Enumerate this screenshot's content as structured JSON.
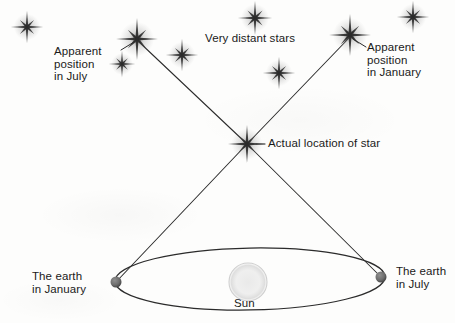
{
  "diagram": {
    "background_color": "#fdfdfc",
    "ink_color": "#2b2b2b",
    "labels": {
      "apparent_july": "Apparent\nposition\nin July",
      "apparent_january": "Apparent\nposition\nin January",
      "very_distant_stars": "Very distant stars",
      "actual_location": "Actual location of star",
      "earth_january": "The earth\nin January",
      "earth_july": "The earth\nin July",
      "sun": "Sun"
    },
    "stars": [
      {
        "name": "background-star-far-left",
        "x": 27,
        "y": 27,
        "size": 17,
        "weight": 1.0
      },
      {
        "name": "apparent-position-july-star",
        "x": 137,
        "y": 39,
        "size": 22,
        "weight": 1.25
      },
      {
        "name": "background-star-below-july",
        "x": 122,
        "y": 64,
        "size": 14,
        "weight": 0.85
      },
      {
        "name": "background-star-left-center",
        "x": 182,
        "y": 55,
        "size": 17,
        "weight": 1.0
      },
      {
        "name": "background-star-top-center",
        "x": 255,
        "y": 18,
        "size": 18,
        "weight": 1.0
      },
      {
        "name": "background-star-right-center",
        "x": 279,
        "y": 73,
        "size": 17,
        "weight": 1.0
      },
      {
        "name": "apparent-position-january-star",
        "x": 350,
        "y": 35,
        "size": 22,
        "weight": 1.25
      },
      {
        "name": "background-star-far-right",
        "x": 413,
        "y": 17,
        "size": 17,
        "weight": 1.0
      },
      {
        "name": "actual-star",
        "x": 247,
        "y": 144,
        "size": 20,
        "weight": 1.15
      }
    ],
    "orbit": {
      "name": "earth-orbit-ellipse",
      "center_x": 250,
      "center_y": 279,
      "radius_x": 135,
      "radius_y": 31,
      "rotation_deg": -1.0
    },
    "sun": {
      "name": "sun-disc",
      "x": 248,
      "y": 282,
      "radius": 19
    },
    "earths": [
      {
        "name": "earth-january-marker",
        "x": 116,
        "y": 282,
        "radius": 5.5
      },
      {
        "name": "earth-july-marker",
        "x": 381,
        "y": 277,
        "radius": 5.5
      }
    ],
    "sight_lines": [
      {
        "name": "sightline-january-to-star",
        "x1": 116,
        "y1": 282,
        "x2": 247,
        "y2": 144
      },
      {
        "name": "sightline-july-to-star",
        "x1": 381,
        "y1": 277,
        "x2": 247,
        "y2": 144
      },
      {
        "name": "sightline-star-to-apparent-july",
        "x1": 247,
        "y1": 144,
        "x2": 138,
        "y2": 41
      },
      {
        "name": "sightline-star-to-apparent-january",
        "x1": 247,
        "y1": 144,
        "x2": 349,
        "y2": 38
      }
    ],
    "leader_lines": [
      {
        "name": "leader-apparent-july",
        "x1": 121,
        "y1": 50,
        "x2": 134,
        "y2": 42
      },
      {
        "name": "leader-apparent-january",
        "x1": 366,
        "y1": 47,
        "x2": 353,
        "y2": 39
      },
      {
        "name": "leader-actual-location",
        "x1": 265,
        "y1": 144,
        "x2": 256,
        "y2": 144
      }
    ]
  }
}
